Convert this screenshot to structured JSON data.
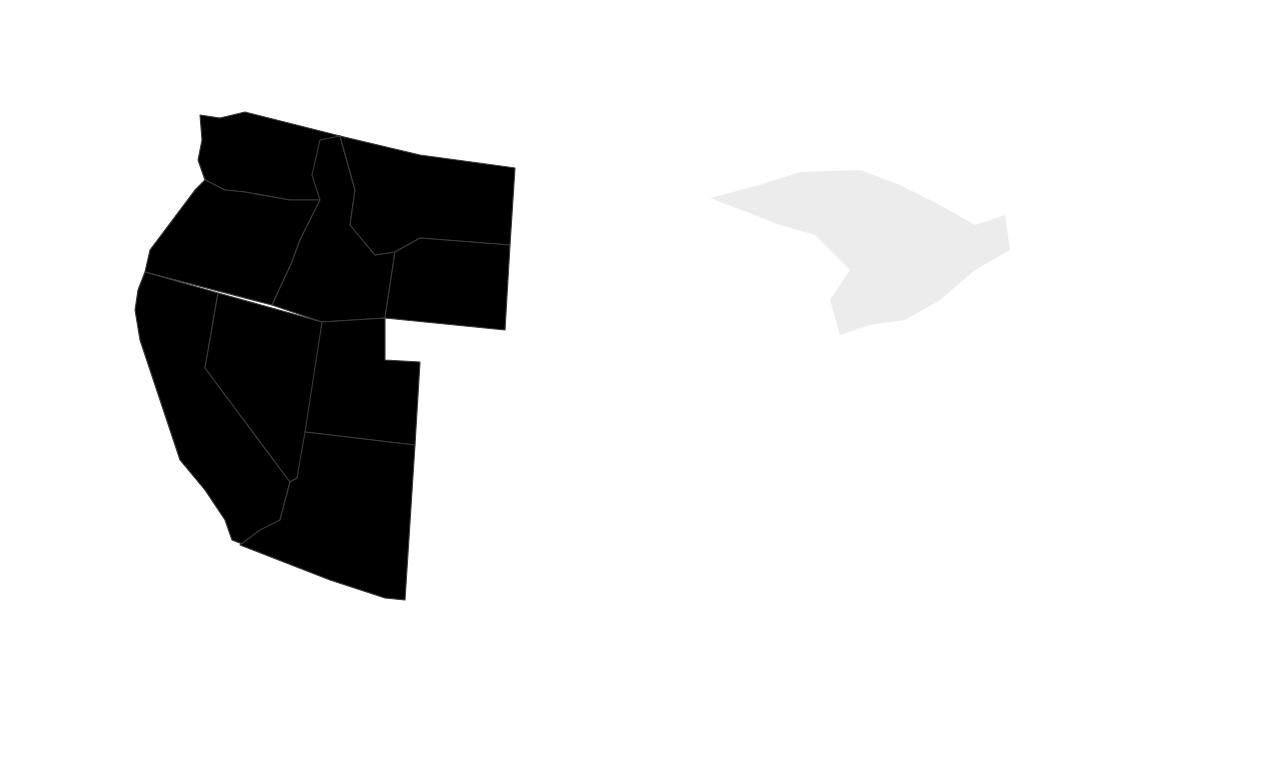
{
  "colors": {
    "tier_60k_plus": "#7b7b7b",
    "tier_55k_59k": "#a8a8a8",
    "tier_50k_54k": "#e3e3e3",
    "tier_45k_49k": "#c8c8c8",
    "tier_below_45k": "#9b9b9b",
    "water": "#ececec",
    "border": "#3a3a3a"
  },
  "callouts": {
    "utah": "Now in his tenth year of middle school teaching, Tom Samuels lives near Salt Lake City, Utah, and earns $45,600 a year.",
    "new_york": "Fresh out of college, J. P. Saunders just landed a teaching job in Albany, New York, with a starting salary of $46,000 a year."
  },
  "legend": {
    "title_line1": "Average Annual",
    "title_line2": "Teacher Salaries",
    "items": [
      {
        "label": "$60,000 and above",
        "tier": "tier_60k_plus"
      },
      {
        "label": "$55,000 and $59,999",
        "tier": "tier_55k_59k"
      },
      {
        "label": "$50,000 to $54,999",
        "tier": "tier_50k_54k"
      },
      {
        "label": "$45,000 to $49,999",
        "tier": "tier_45k_49k"
      },
      {
        "label": "Below $45,000",
        "tier": "tier_below_45k"
      }
    ]
  },
  "us_average": "U.S. average: $55,350",
  "states": [
    {
      "id": "WA",
      "label": "WASHINGTON",
      "tier": "tier_50k_54k"
    },
    {
      "id": "OR",
      "label": "OREGON",
      "tier": "tier_55k_59k"
    },
    {
      "id": "CA",
      "label": "CALIFORNIA",
      "tier": "tier_60k_plus"
    },
    {
      "id": "NV",
      "label": "NEVADA",
      "tier": "tier_50k_54k"
    },
    {
      "id": "ID",
      "label": "IDAHO",
      "tier": "tier_45k_49k"
    },
    {
      "id": "MT",
      "label": "MONTANA",
      "tier": "tier_45k_49k"
    },
    {
      "id": "WY",
      "label": "WYOMING",
      "tier": "tier_55k_59k"
    },
    {
      "id": "UT",
      "label": "UTAH",
      "tier": "tier_below_45k"
    },
    {
      "id": "AZ",
      "label": "ARIZONA",
      "tier": "tier_45k_49k"
    },
    {
      "id": "CO",
      "label": "COLORADO",
      "tier": "tier_45k_49k"
    },
    {
      "id": "NM",
      "label": "NEW MEXICO",
      "tier": "tier_45k_49k"
    },
    {
      "id": "ND",
      "label": "NORTH DAKOTA",
      "tier": "tier_below_45k"
    },
    {
      "id": "SD",
      "label": "SOUTH DAKOTA",
      "tier": "tier_below_45k"
    },
    {
      "id": "NE",
      "label": "NEBRASKA",
      "tier": "tier_45k_49k"
    },
    {
      "id": "KS",
      "label": "KANSAS",
      "tier": "tier_45k_49k"
    },
    {
      "id": "OK",
      "label": "OKLAHOMA",
      "tier": "tier_below_45k"
    },
    {
      "id": "TX",
      "label": "TEXAS",
      "tier": "tier_45k_49k"
    },
    {
      "id": "MN",
      "label": "MINNESOTA",
      "tier": "tier_50k_54k"
    },
    {
      "id": "IA",
      "label": "IOWA",
      "tier": "tier_50k_54k"
    },
    {
      "id": "MO",
      "label": "MISSOURI",
      "tier": "tier_45k_49k"
    },
    {
      "id": "AR",
      "label": "ARKANSAS",
      "tier": "tier_45k_49k"
    },
    {
      "id": "LA",
      "label": "LOUISIANA",
      "tier": "tier_50k_54k"
    },
    {
      "id": "WI",
      "label": "WISCONSIN",
      "tier": "tier_50k_54k"
    },
    {
      "id": "IL",
      "label": "ILLINOIS",
      "tier": "tier_60k_plus"
    },
    {
      "id": "MI",
      "label": "MICHIGAN",
      "tier": "tier_55k_59k"
    },
    {
      "id": "IN",
      "label": "INDIANA",
      "tier": "tier_45k_49k"
    },
    {
      "id": "OH",
      "label": "OHIO",
      "tier": "tier_55k_59k"
    },
    {
      "id": "KY",
      "label": "KENTUCKY",
      "tier": "tier_45k_49k"
    },
    {
      "id": "TN",
      "label": "TENNESSEE",
      "tier": "tier_45k_49k"
    },
    {
      "id": "MS",
      "label": "MISSISSIPPI",
      "tier": "tier_45k_49k"
    },
    {
      "id": "AL",
      "label": "ALABAMA",
      "tier": "tier_45k_49k"
    },
    {
      "id": "GA",
      "label": "GEORGIA",
      "tier": "tier_50k_54k"
    },
    {
      "id": "FL",
      "label": "FLORIDA",
      "tier": "tier_45k_49k"
    },
    {
      "id": "SC",
      "label": "SOUTH CAROLINA",
      "tier": "tier_45k_49k"
    },
    {
      "id": "NC",
      "label": "NORTH CAROLINA",
      "tier": "tier_45k_49k"
    },
    {
      "id": "VA",
      "label": "VIRGINIA",
      "tier": "tier_45k_49k"
    },
    {
      "id": "WV",
      "label": "WEST VIRGINIA",
      "tier": "tier_45k_49k"
    },
    {
      "id": "PA",
      "label": "PENNSYLVANIA",
      "tier": "tier_55k_59k"
    },
    {
      "id": "NY",
      "label": "NEW YORK",
      "tier": "tier_60k_plus"
    },
    {
      "id": "VT",
      "label": "VERMONT",
      "tier": "tier_45k_49k"
    },
    {
      "id": "NH",
      "label": "NEW HAMPSHIRE",
      "tier": "tier_50k_54k"
    },
    {
      "id": "ME",
      "label": "MAINE",
      "tier": "tier_45k_49k"
    },
    {
      "id": "MA",
      "label": "MASSACHUSETTS",
      "tier": "tier_60k_plus"
    },
    {
      "id": "RI",
      "label": "RHODE ISLAND",
      "tier": "tier_55k_59k"
    },
    {
      "id": "CT",
      "label": "CONNECTICUT",
      "tier": "tier_60k_plus"
    },
    {
      "id": "NJ",
      "label": "NEW JERSEY",
      "tier": "tier_60k_plus"
    },
    {
      "id": "DE",
      "label": "DELAWARE",
      "tier": "tier_55k_59k"
    },
    {
      "id": "MD",
      "label": "MARYLAND",
      "tier": "tier_60k_plus"
    },
    {
      "id": "DC",
      "label": "D.C.",
      "tier": "tier_60k_plus"
    },
    {
      "id": "AK",
      "label": "ALASKA",
      "tier": "tier_55k_59k"
    },
    {
      "id": "HI",
      "label": "HAWAII",
      "tier": "tier_55k_59k"
    }
  ]
}
